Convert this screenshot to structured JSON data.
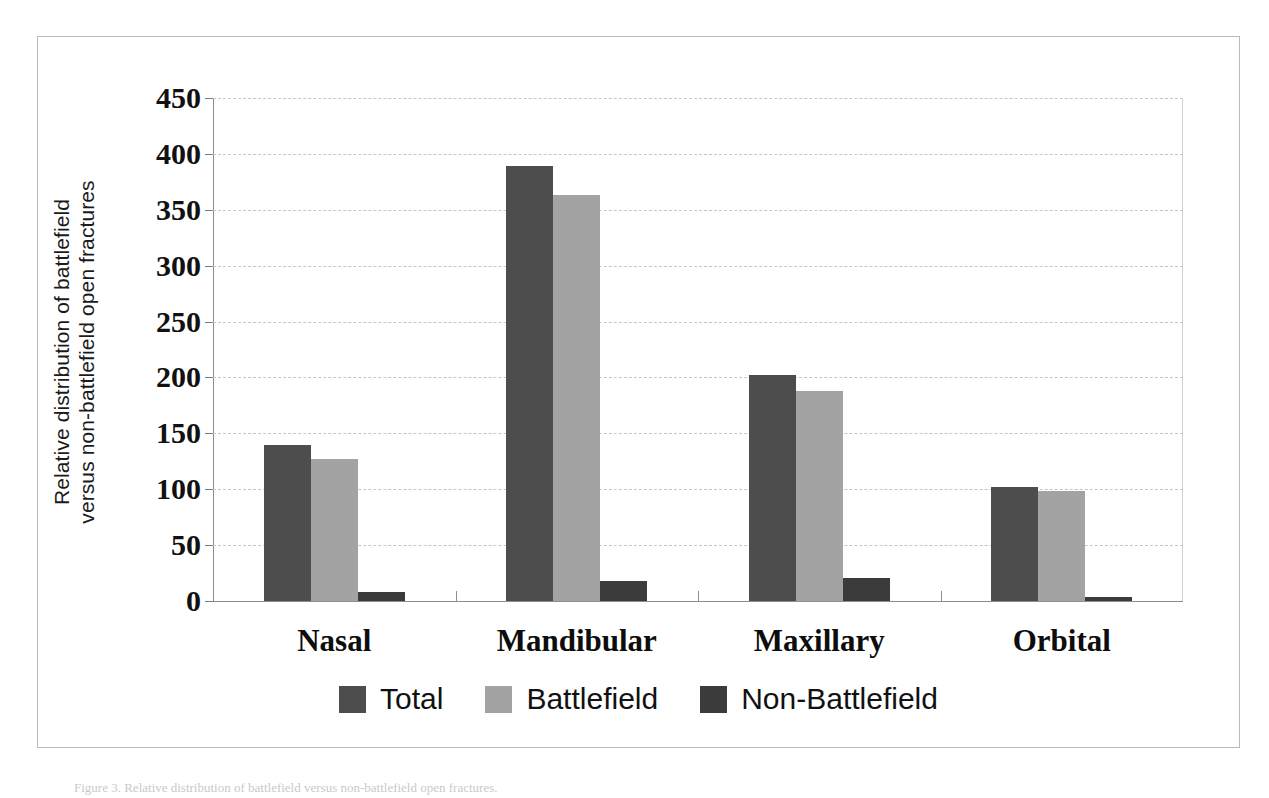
{
  "figure": {
    "caption": "Figure 3. Relative distribution of battlefield versus non-battlefield open fractures."
  },
  "axes": {
    "y_title_line1": "Relative distribution of battlefield",
    "y_title_line2": "versus non-battlefield open fractures",
    "y_ticks": [
      "450",
      "400",
      "350",
      "300",
      "250",
      "200",
      "150",
      "100",
      "50",
      "0"
    ]
  },
  "legend": {
    "items": [
      {
        "label": "Total",
        "color": "#4d4d4d"
      },
      {
        "label": "Battlefield",
        "color": "#a3a3a3"
      },
      {
        "label": "Non-Battlefield",
        "color": "#3b3b3b"
      }
    ]
  },
  "chart_data": {
    "type": "bar",
    "title": "",
    "xlabel": "",
    "ylabel": "Relative distribution of battlefield versus non-battlefield open fractures",
    "ylim": [
      0,
      450
    ],
    "ytick_step": 50,
    "grid": true,
    "legend_position": "bottom",
    "categories": [
      "Nasal",
      "Mandibular",
      "Maxillary",
      "Orbital"
    ],
    "series": [
      {
        "name": "Total",
        "color": "#4d4d4d",
        "values": [
          140,
          389,
          202,
          102
        ]
      },
      {
        "name": "Battlefield",
        "color": "#a3a3a3",
        "values": [
          127,
          363,
          188,
          98
        ]
      },
      {
        "name": "Non-Battlefield",
        "color": "#3b3b3b",
        "values": [
          8,
          18,
          21,
          4
        ]
      }
    ]
  }
}
